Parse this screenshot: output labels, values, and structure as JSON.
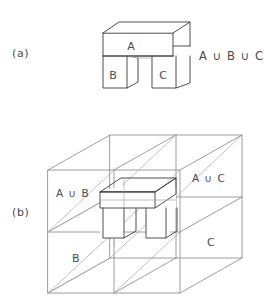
{
  "figure": {
    "background_color": "#ffffff",
    "ink_color": "#3a3a3a",
    "light_ink_color": "#7d7d82"
  },
  "panels": [
    {
      "id": "a",
      "label": "(a)",
      "expression": "A ∪ B ∪ C",
      "part_labels": [
        "A",
        "B",
        "C"
      ],
      "description": "An arch shaped solid: a horizontal slab A on top resting on two legs B and C"
    },
    {
      "id": "b",
      "label": "(b)",
      "face_labels": [
        "A ∪ B",
        "A ∪ C",
        "B",
        "C"
      ],
      "description": "A large transparent box divided into cells, containing a small copy of the arch at its centre"
    }
  ],
  "panel_a": {
    "label": "(a)",
    "expression": "A ∪ B ∪ C",
    "top_block_label": "A",
    "left_leg_label": "B",
    "right_leg_label": "C"
  },
  "panel_b": {
    "label": "(b)",
    "upper_left_label": "A ∪ B",
    "upper_right_label": "A ∪ C",
    "lower_left_label": "B",
    "lower_right_label": "C"
  },
  "symbols": {
    "union": "∪"
  }
}
